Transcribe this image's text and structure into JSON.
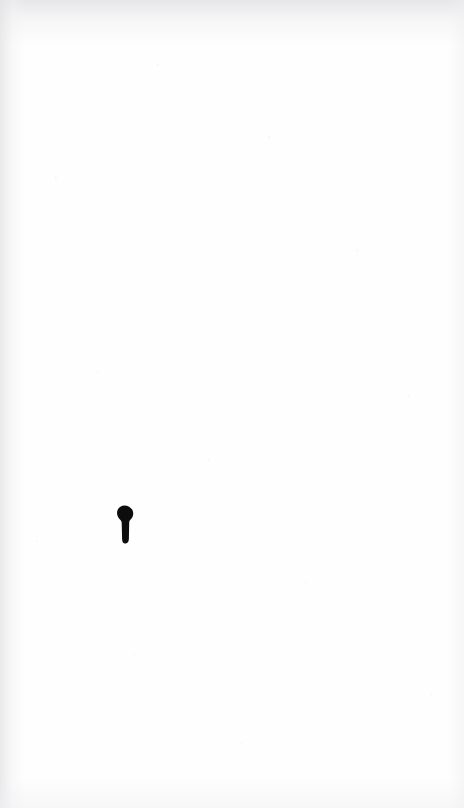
{
  "page": {
    "kind": "scanned-page",
    "width": 464,
    "height": 808,
    "background_color": "#fefefe",
    "text_content": "",
    "notes_visible": "none"
  },
  "ink_mark": {
    "icon_name": "keyhole-glyph",
    "description": "small solid black glyph with a rounded head and a narrower tapered stem",
    "color": "#0d0d0d",
    "x": 116,
    "y": 505,
    "width": 18,
    "height": 39
  },
  "paper": {
    "edge_shading_color": "#e4e4e6",
    "speckle_color": "#dcdcdf"
  }
}
